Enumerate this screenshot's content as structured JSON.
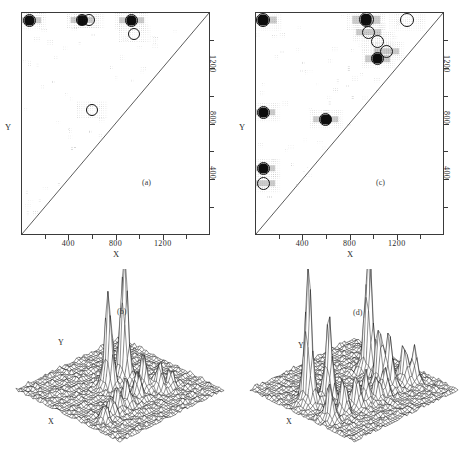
{
  "figure": {
    "panels": [
      {
        "tag": "(a)",
        "type": "contour-2d"
      },
      {
        "tag": "(b)",
        "type": "surface-3d"
      },
      {
        "tag": "(c)",
        "type": "contour-2d"
      },
      {
        "tag": "(d)",
        "type": "surface-3d"
      }
    ]
  },
  "axes": {
    "x_title": "X",
    "y_title": "Y",
    "x_ticklabels": [
      "400",
      "800",
      "1200"
    ],
    "y_ticklabels": [
      "1200",
      "800",
      "400"
    ],
    "x_range": [
      0,
      1600
    ],
    "y_range": [
      0,
      1600
    ],
    "x_major": [
      400,
      800,
      1200
    ],
    "y_major": [
      400,
      800,
      1200
    ],
    "x_minor": [
      200,
      600,
      1000,
      1400
    ],
    "y_minor": [
      200,
      600,
      1000,
      1400
    ]
  },
  "surface_labels": {
    "x_title": "X",
    "y_title": "Y"
  },
  "chart_data": [
    {
      "type": "scatter",
      "panel": "(a)",
      "title": "",
      "xlabel": "X",
      "ylabel": "Y",
      "xlim": [
        0,
        1600
      ],
      "ylim": [
        0,
        1600
      ],
      "grid": false,
      "diagonal_line": true,
      "legend": "none",
      "annotation": "(a)",
      "series": [
        {
          "name": "cross-peaks",
          "points": [
            {
              "x": 70,
              "y": 1540,
              "style": "ring-filled",
              "size": 13
            },
            {
              "x": 520,
              "y": 1540,
              "style": "ring-filled",
              "size": 12
            },
            {
              "x": 575,
              "y": 1540,
              "style": "ring-open",
              "size": 12
            },
            {
              "x": 935,
              "y": 1540,
              "style": "ring-filled",
              "size": 13
            },
            {
              "x": 960,
              "y": 1440,
              "style": "ring-open",
              "size": 12
            },
            {
              "x": 600,
              "y": 895,
              "style": "ring-open",
              "size": 12
            }
          ]
        }
      ]
    },
    {
      "type": "surface",
      "panel": "(b)",
      "title": "",
      "xlabel": "X",
      "ylabel": "Y",
      "annotation": "(b)",
      "grid": true,
      "description": "3-D mesh surface; two dominant tall peaks right-of-centre plus a ridge of smaller peaks across the mid-field",
      "peaks": [
        {
          "x": 0.6,
          "y": 0.56,
          "height": 1.0
        },
        {
          "x": 0.47,
          "y": 0.58,
          "height": 0.74
        },
        {
          "x": 0.63,
          "y": 0.4,
          "height": 0.26
        },
        {
          "x": 0.53,
          "y": 0.36,
          "height": 0.18
        },
        {
          "x": 0.4,
          "y": 0.34,
          "height": 0.2
        },
        {
          "x": 0.31,
          "y": 0.33,
          "height": 0.17
        },
        {
          "x": 0.22,
          "y": 0.3,
          "height": 0.15
        },
        {
          "x": 0.13,
          "y": 0.27,
          "height": 0.13
        },
        {
          "x": 0.71,
          "y": 0.33,
          "height": 0.2
        },
        {
          "x": 0.78,
          "y": 0.29,
          "height": 0.14
        }
      ]
    },
    {
      "type": "scatter",
      "panel": "(c)",
      "title": "",
      "xlabel": "X",
      "ylabel": "Y",
      "xlim": [
        0,
        1600
      ],
      "ylim": [
        0,
        1600
      ],
      "grid": false,
      "diagonal_line": true,
      "legend": "none",
      "annotation": "(c)",
      "series": [
        {
          "name": "cross-peaks",
          "points": [
            {
              "x": 70,
              "y": 1540,
              "style": "ring-filled",
              "size": 14
            },
            {
              "x": 940,
              "y": 1545,
              "style": "ring-filled",
              "size": 15
            },
            {
              "x": 1290,
              "y": 1540,
              "style": "ring-open",
              "size": 14
            },
            {
              "x": 965,
              "y": 1455,
              "style": "ring-shaded",
              "size": 13
            },
            {
              "x": 1040,
              "y": 1390,
              "style": "ring-open",
              "size": 13
            },
            {
              "x": 1115,
              "y": 1320,
              "style": "ring-shaded",
              "size": 13
            },
            {
              "x": 1040,
              "y": 1265,
              "style": "ring-filled",
              "size": 13
            },
            {
              "x": 70,
              "y": 880,
              "style": "ring-filled",
              "size": 13
            },
            {
              "x": 600,
              "y": 830,
              "style": "ring-filled",
              "size": 13
            },
            {
              "x": 70,
              "y": 480,
              "style": "ring-filled",
              "size": 13
            },
            {
              "x": 70,
              "y": 370,
              "style": "ring-shaded",
              "size": 13
            }
          ]
        }
      ]
    },
    {
      "type": "surface",
      "panel": "(d)",
      "title": "",
      "xlabel": "X",
      "ylabel": "Y",
      "annotation": "(d)",
      "grid": true,
      "description": "3-D mesh surface; two very tall peaks at left and right plus many medium peaks spread across the field",
      "peaks": [
        {
          "x": 0.16,
          "y": 0.6,
          "height": 1.0
        },
        {
          "x": 0.74,
          "y": 0.6,
          "height": 0.98
        },
        {
          "x": 0.28,
          "y": 0.52,
          "height": 0.62
        },
        {
          "x": 0.66,
          "y": 0.42,
          "height": 0.45
        },
        {
          "x": 0.7,
          "y": 0.36,
          "height": 0.38
        },
        {
          "x": 0.82,
          "y": 0.34,
          "height": 0.3
        },
        {
          "x": 0.88,
          "y": 0.3,
          "height": 0.24
        },
        {
          "x": 0.44,
          "y": 0.33,
          "height": 0.22
        },
        {
          "x": 0.36,
          "y": 0.34,
          "height": 0.24
        },
        {
          "x": 0.52,
          "y": 0.3,
          "height": 0.18
        },
        {
          "x": 0.24,
          "y": 0.34,
          "height": 0.26
        },
        {
          "x": 0.1,
          "y": 0.33,
          "height": 0.28
        },
        {
          "x": 0.6,
          "y": 0.31,
          "height": 0.2
        }
      ]
    }
  ]
}
